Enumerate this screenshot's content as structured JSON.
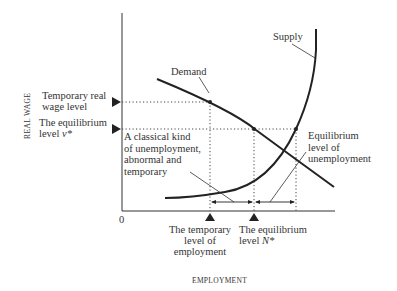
{
  "diagram": {
    "type": "labour-market supply and demand diagram",
    "axes": {
      "y_label": "REAL WAGE",
      "x_label": "EMPLOYMENT",
      "origin_label": "0"
    },
    "curves": {
      "demand_label": "Demand",
      "supply_label": "Supply"
    },
    "y_markers": {
      "temporary_wage": [
        "Temporary real",
        "wage level"
      ],
      "equilibrium_wage_line1": "The equilibrium",
      "equilibrium_wage_line2_prefix": "level ",
      "equilibrium_wage_symbol": "ν*"
    },
    "x_markers": {
      "temporary_employment": [
        "The temporary",
        "level of",
        "employment"
      ],
      "equilibrium_employment_line1": "The equilibrium",
      "equilibrium_employment_line2_prefix": "level ",
      "equilibrium_employment_symbol": "N*"
    },
    "annotations": {
      "classical_unemployment": [
        "A classical kind",
        "of unemployment,",
        "abnormal and",
        "temporary"
      ],
      "equilibrium_unemployment": [
        "Equilibrium",
        "level of",
        "unemployment"
      ]
    },
    "colors": {
      "ink": "#222222",
      "background": "#ffffff"
    }
  }
}
